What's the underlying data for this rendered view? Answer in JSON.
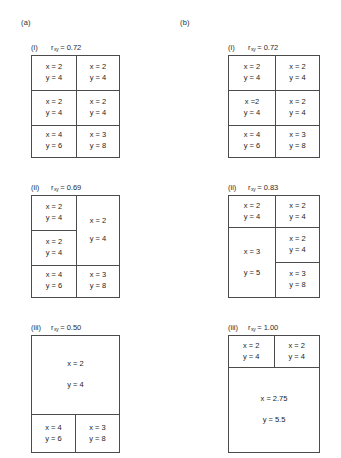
{
  "panels": [
    {
      "tag": "(a)"
    },
    {
      "tag": "(b)"
    }
  ],
  "symbols": {
    "r": "r",
    "subscript": "xy",
    "equals": "= "
  },
  "figures": {
    "a_i": {
      "roman": "(i)",
      "r_value": "0.72"
    },
    "a_ii": {
      "roman": "(ii)",
      "r_value": "0.69"
    },
    "a_iii": {
      "roman": "(iii)",
      "r_value": "0.50"
    },
    "b_i": {
      "roman": "(i)",
      "r_value": "0.72"
    },
    "b_ii": {
      "roman": "(ii)",
      "r_value": "0.83"
    },
    "b_iii": {
      "roman": "(iii)",
      "r_value": "1.00"
    }
  },
  "cells": {
    "a_i": {
      "r1c1_x": "x = 2",
      "r1c1_y": "y = 4",
      "r1c2_x": "x = 2",
      "r1c2_y": "y = 4",
      "r2c1_x": "x = 2",
      "r2c1_y": "y = 4",
      "r2c2_x": "x = 2",
      "r2c2_y": "y = 4",
      "r3c1_x": "x = 4",
      "r3c1_y": "y = 6",
      "r3c2_x": "x = 3",
      "r3c2_y": "y = 8"
    },
    "a_ii": {
      "r1c1_x": "x = 2",
      "r1c1_y": "y = 4",
      "r2c1_x": "x = 2",
      "r2c1_y": "y = 4",
      "merge_x": "x = 2",
      "merge_y": "y = 4",
      "r3c1_x": "x = 4",
      "r3c1_y": "y = 6",
      "r3c2_x": "x = 3",
      "r3c2_y": "y = 8"
    },
    "a_iii": {
      "merge_x": "x = 2",
      "merge_y": "y = 4",
      "r3c1_x": "x = 4",
      "r3c1_y": "y = 6",
      "r3c2_x": "x = 3",
      "r3c2_y": "y = 8"
    },
    "b_i": {
      "r1c1_x": "x = 2",
      "r1c1_y": "y = 4",
      "r1c2_x": "x = 2",
      "r1c2_y": "y = 4",
      "r2c1_x": "x =2",
      "r2c1_y": "y = 4",
      "r2c2_x": "x = 2",
      "r2c2_y": "y = 4",
      "r3c1_x": "x = 4",
      "r3c1_y": "y = 6",
      "r3c2_x": "x = 3",
      "r3c2_y": "y = 8"
    },
    "b_ii": {
      "r1c1_x": "x = 2",
      "r1c1_y": "y = 4",
      "r1c2_x": "x = 2",
      "r1c2_y": "y = 4",
      "merge_x": "x = 3",
      "merge_y": "y = 5",
      "r2c2_x": "x = 2",
      "r2c2_y": "y = 4",
      "r3c2_x": "x = 3",
      "r3c2_y": "y = 8"
    },
    "b_iii": {
      "r1c1_x": "x = 2",
      "r1c1_y": "y = 4",
      "r1c2_x": "x = 2",
      "r1c2_y": "y = 4",
      "merge_x": "x = 2.75",
      "merge_y": "y = 5.5"
    }
  }
}
